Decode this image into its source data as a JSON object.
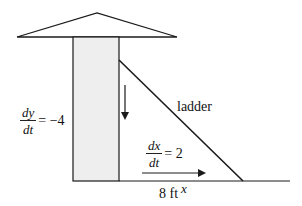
{
  "diagram": {
    "type": "related-rates ladder problem",
    "labels": {
      "ladder": "ladder",
      "base_distance": "8 ft",
      "x_variable": "x",
      "dy_dt": {
        "numerator": "dy",
        "denominator": "dt",
        "rhs": "= −4"
      },
      "dx_dt": {
        "numerator": "dx",
        "denominator": "dt",
        "rhs": "= 2"
      }
    },
    "colors": {
      "line": "#1a1a1a",
      "building_fill": "#eeeeee",
      "background": "#ffffff"
    },
    "shapes": {
      "roof": {
        "apex": [
          97,
          13
        ],
        "left": [
          17,
          37
        ],
        "right": [
          177,
          37
        ]
      },
      "building": {
        "x": 73,
        "y": 37,
        "width": 46,
        "height": 144
      },
      "ground": {
        "x1": 119,
        "x2": 290,
        "y": 181
      },
      "ladder": {
        "top": [
          119,
          60
        ],
        "foot": [
          243,
          181
        ]
      },
      "arrow_down": {
        "x": 125,
        "y1": 85,
        "y2": 118
      },
      "arrow_right": {
        "x1": 142,
        "x2": 204,
        "y": 173
      }
    }
  }
}
